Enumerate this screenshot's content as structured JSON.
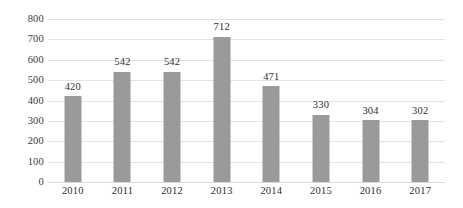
{
  "chart_data": {
    "type": "bar",
    "title": "",
    "subtitle": "",
    "xlabel": "",
    "ylabel": "",
    "categories": [
      "2010",
      "2011",
      "2012",
      "2013",
      "2014",
      "2015",
      "2016",
      "2017"
    ],
    "values": [
      420,
      542,
      542,
      712,
      471,
      330,
      304,
      302
    ],
    "data_labels": [
      "420",
      "542",
      "542",
      "712",
      "471",
      "330",
      "304",
      "302"
    ],
    "ylim": [
      0,
      800
    ],
    "ytick_values": [
      0,
      100,
      200,
      300,
      400,
      500,
      600,
      700,
      800
    ],
    "ytick_labels": [
      "0",
      "100",
      "200",
      "300",
      "400",
      "500",
      "600",
      "700",
      "800"
    ],
    "grid": true,
    "grid_axis": "y",
    "legend": false,
    "legend_position": "none",
    "bar_color": "#9a9a9a",
    "gridline_color": "#e3e3e3",
    "background_color": "#ffffff",
    "text_color": "#2e2e2e"
  }
}
